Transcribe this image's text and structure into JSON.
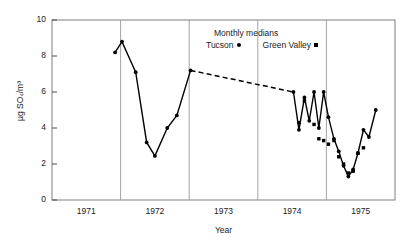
{
  "chart_data": {
    "type": "line",
    "title": "",
    "xlabel": "Year",
    "ylabel": "µg SO₄/m³",
    "xlim": [
      1970.5,
      1975.5
    ],
    "ylim": [
      0,
      10
    ],
    "ytick_labels": [
      "0",
      "2",
      "4",
      "6",
      "8",
      "10"
    ],
    "ytick_values": [
      0,
      2,
      4,
      6,
      8,
      10
    ],
    "xtick_labels": [
      "1971",
      "1972",
      "1973",
      "1974",
      "1975"
    ],
    "xtick_values": [
      1971,
      1972,
      1973,
      1974,
      1975
    ],
    "grid": "vertical gridlines at year boundaries",
    "legend_position": "top-center inside axes",
    "legend_title": "Monthly medians",
    "series": [
      {
        "name": "Tucson",
        "marker": "circle",
        "color": "#000000",
        "linestyle": "solid-with-dashed-gap",
        "x": [
          1971.42,
          1971.52,
          1971.72,
          1971.88,
          1972.0,
          1972.18,
          1972.32,
          1972.52,
          1974.02,
          1974.1,
          1974.18,
          1974.25,
          1974.32,
          1974.39,
          1974.46,
          1974.53,
          1974.61,
          1974.68,
          1974.75,
          1974.82,
          1974.89,
          1974.96,
          1975.04,
          1975.12,
          1975.22
        ],
        "y": [
          8.2,
          8.8,
          7.1,
          3.2,
          2.45,
          4.0,
          4.7,
          7.2,
          6.0,
          3.9,
          5.7,
          4.4,
          6.0,
          4.0,
          6.0,
          4.6,
          3.4,
          2.7,
          1.9,
          1.3,
          1.7,
          2.6,
          3.9,
          3.5,
          5.0
        ],
        "dashed_gap": {
          "from_x": 1972.52,
          "from_y": 7.2,
          "to_x": 1974.02,
          "to_y": 6.0
        }
      },
      {
        "name": "Green Valley",
        "marker": "square",
        "color": "#000000",
        "linestyle": "none",
        "x": [
          1974.1,
          1974.18,
          1974.32,
          1974.39,
          1974.46,
          1974.53,
          1974.61,
          1974.68,
          1974.75,
          1974.82,
          1974.89,
          1974.96,
          1975.04
        ],
        "y": [
          4.3,
          5.5,
          4.2,
          3.4,
          3.3,
          3.1,
          3.3,
          2.4,
          2.0,
          1.5,
          1.6,
          2.6,
          2.9
        ]
      }
    ]
  },
  "legend": {
    "title": "Monthly medians",
    "entries": [
      {
        "label": "Tucson",
        "marker": "circle-marker-icon"
      },
      {
        "label": "Green Valley",
        "marker": "square-marker-icon"
      }
    ]
  },
  "axes": {
    "y_title": "µg SO₄/m³",
    "x_title": "Year"
  }
}
